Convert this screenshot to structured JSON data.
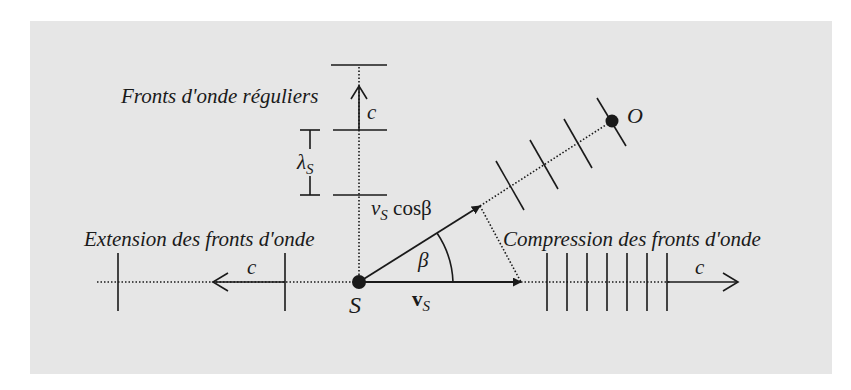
{
  "diagram": {
    "background_color": "#e6e6e6",
    "ink_color": "#1a1a1a",
    "labels": {
      "regular_fronts": "Fronts d'onde réguliers",
      "extension": "Extension des fronts d'onde",
      "compression": "Compression des fronts d'onde",
      "c_up": "c",
      "c_left": "c",
      "c_right": "c",
      "lambda": "λ",
      "lambda_sub": "S",
      "vs_cos_v": "v",
      "vs_cos_sub": "S",
      "vs_cos_rest": " cosβ",
      "beta": "β",
      "source": "S",
      "observer": "O",
      "vs_v": "v",
      "vs_sub": "S"
    },
    "points": {
      "source": {
        "name": "S",
        "x": 359,
        "y": 282
      },
      "observer": {
        "name": "O",
        "x": 612,
        "y": 121
      }
    },
    "geometry": {
      "horizontal_axis_y": 282,
      "velocity_vector_end_x": 521,
      "oblique_vector_end": {
        "x": 480,
        "y": 206
      },
      "upward_fronts_y": [
        65,
        130,
        195
      ],
      "extension_fronts_x": [
        118,
        285
      ],
      "compression_fronts_x": [
        547,
        567,
        587,
        607,
        627,
        647,
        667
      ],
      "oblique_fronts_t": [
        0.6,
        0.733,
        0.866,
        1.0
      ]
    }
  }
}
